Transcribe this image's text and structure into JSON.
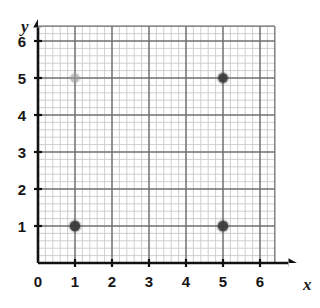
{
  "chart_data": {
    "type": "scatter",
    "title": "",
    "xlabel": "x",
    "ylabel": "y",
    "xlim": [
      0,
      6.4
    ],
    "ylim": [
      0,
      6.4
    ],
    "xticks": [
      0,
      1,
      2,
      3,
      4,
      5,
      6
    ],
    "yticks": [
      0,
      1,
      2,
      3,
      4,
      5,
      6
    ],
    "xtick_labels": [
      "0",
      "1",
      "2",
      "3",
      "4",
      "5",
      "6"
    ],
    "ytick_labels": [
      "0",
      "1",
      "2",
      "3",
      "4",
      "5",
      "6"
    ],
    "grid": true,
    "grid_minor": true,
    "minor_divisions_per_unit": 5,
    "legend": "none",
    "points": [
      {
        "label": "point-1-1",
        "x": 1,
        "y": 1,
        "color": "#3a3a3a",
        "marker": "dot",
        "size": 5.2,
        "opacity": 0.95
      },
      {
        "label": "point-5-1",
        "x": 5,
        "y": 1,
        "color": "#3a3a3a",
        "marker": "dot",
        "size": 5.2,
        "opacity": 0.92
      },
      {
        "label": "point-5-5",
        "x": 5,
        "y": 5,
        "color": "#3a3a3a",
        "marker": "dot",
        "size": 4.8,
        "opacity": 0.9
      },
      {
        "label": "point-1-5",
        "x": 1,
        "y": 5,
        "color": "#9a9a9a",
        "marker": "dot",
        "size": 4.6,
        "opacity": 0.55
      }
    ]
  },
  "axes": {
    "x_axis_label": "x",
    "y_axis_label": "y",
    "origin_label": "0"
  },
  "colors": {
    "background": "#ffffff",
    "axis": "#111111",
    "grid_major": "#6f6f6f",
    "grid_minor": "#c9c9c9",
    "point_dark": "#3a3a3a",
    "point_faint": "#9a9a9a",
    "text": "#161616"
  },
  "geometry": {
    "origin_x": 38,
    "origin_y": 263,
    "unit_px": 37,
    "grid_right": 283,
    "grid_top": 33,
    "minor_px": 7.4
  }
}
